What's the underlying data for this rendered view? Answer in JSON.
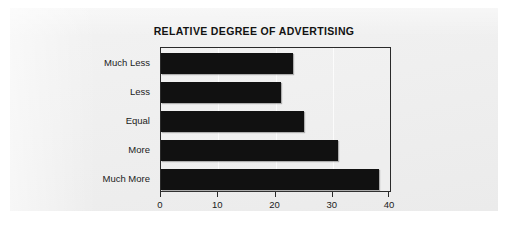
{
  "figure": {
    "title": "RELATIVE DEGREE OF ADVERTISING",
    "background_color": "#efefef",
    "bar_color": "#111111",
    "axis_color": "#2a2a2a"
  },
  "chart_data": {
    "type": "bar",
    "orientation": "horizontal",
    "title": "RELATIVE DEGREE OF ADVERTISING",
    "xlabel": "",
    "ylabel": "",
    "categories": [
      "Much Less",
      "Less",
      "Equal",
      "More",
      "Much More"
    ],
    "values": [
      23,
      21,
      25,
      31,
      38
    ],
    "series": [
      {
        "name": "Relative degree of advertising",
        "values": [
          23,
          21,
          25,
          31,
          38
        ]
      }
    ],
    "xlim": [
      0,
      40
    ],
    "xticks": [
      0,
      10,
      20,
      30,
      40
    ],
    "xtick_labels": [
      "0",
      "10",
      "20",
      "30",
      "40"
    ],
    "grid": true,
    "grid_axis": "x",
    "legend": false,
    "legend_position": "none"
  }
}
